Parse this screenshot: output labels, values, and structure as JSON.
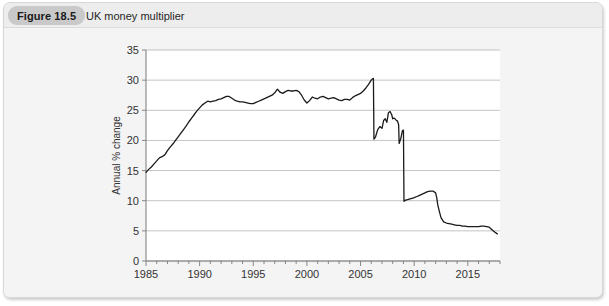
{
  "figure": {
    "badge_label": "Figure 18.5",
    "title": "UK money multiplier"
  },
  "chart_data": {
    "type": "line",
    "title": "UK money multiplier",
    "xlabel": "",
    "ylabel": "Annual % change",
    "xlim": [
      1985,
      2018
    ],
    "ylim": [
      0,
      35
    ],
    "grid": true,
    "legend": null,
    "y_ticks": [
      0,
      5,
      10,
      15,
      20,
      25,
      30,
      35
    ],
    "x_ticks": [
      1985,
      1990,
      1995,
      2000,
      2005,
      2010,
      2015
    ],
    "x_tick_labels": [
      "1985",
      "1990",
      "1995",
      "2000",
      "2005",
      "2010",
      "2015"
    ],
    "y_tick_labels": [
      "0",
      "5",
      "10",
      "15",
      "20",
      "25",
      "30",
      "35"
    ],
    "x_minor_tick_interval": 1,
    "line_color": "#1a1a1a",
    "series": [
      {
        "name": "UK money multiplier",
        "x": [
          1985.0,
          1985.25,
          1985.5,
          1985.75,
          1986.0,
          1986.25,
          1986.5,
          1986.75,
          1987.0,
          1987.25,
          1987.5,
          1987.75,
          1988.0,
          1988.25,
          1988.5,
          1988.75,
          1989.0,
          1989.25,
          1989.5,
          1989.75,
          1990.0,
          1990.25,
          1990.5,
          1990.75,
          1991.0,
          1991.25,
          1991.5,
          1991.75,
          1992.0,
          1992.25,
          1992.5,
          1992.75,
          1993.0,
          1993.25,
          1993.5,
          1993.75,
          1994.0,
          1994.25,
          1994.5,
          1994.75,
          1995.0,
          1995.25,
          1995.5,
          1995.75,
          1996.0,
          1996.25,
          1996.5,
          1996.75,
          1997.0,
          1997.25,
          1997.5,
          1997.75,
          1998.0,
          1998.25,
          1998.5,
          1998.75,
          1999.0,
          1999.25,
          1999.5,
          1999.75,
          2000.0,
          2000.25,
          2000.5,
          2000.75,
          2001.0,
          2001.25,
          2001.5,
          2001.75,
          2002.0,
          2002.25,
          2002.5,
          2002.75,
          2003.0,
          2003.25,
          2003.5,
          2003.75,
          2004.0,
          2004.25,
          2004.5,
          2004.75,
          2005.0,
          2005.25,
          2005.5,
          2005.75,
          2006.0,
          2006.1,
          2006.2,
          2006.25,
          2006.4,
          2006.6,
          2006.8,
          2007.0,
          2007.15,
          2007.3,
          2007.45,
          2007.6,
          2007.75,
          2007.9,
          2008.0,
          2008.15,
          2008.3,
          2008.45,
          2008.55,
          2008.6,
          2008.75,
          2008.9,
          2009.0,
          2009.05,
          2009.2,
          2009.4,
          2009.6,
          2009.8,
          2010.0,
          2010.25,
          2010.5,
          2010.75,
          2011.0,
          2011.25,
          2011.5,
          2011.75,
          2012.0,
          2012.1,
          2012.2,
          2012.35,
          2012.5,
          2012.75,
          2013.0,
          2013.25,
          2013.5,
          2013.75,
          2014.0,
          2014.25,
          2014.5,
          2014.75,
          2015.0,
          2015.25,
          2015.5,
          2015.75,
          2016.0,
          2016.25,
          2016.5,
          2016.75,
          2017.0,
          2017.25,
          2017.5,
          2017.75
        ],
        "values": [
          14.7,
          15.2,
          15.6,
          16.1,
          16.6,
          17.1,
          17.3,
          17.6,
          18.3,
          18.9,
          19.4,
          20.0,
          20.6,
          21.2,
          21.8,
          22.4,
          23.1,
          23.7,
          24.3,
          24.9,
          25.4,
          25.9,
          26.2,
          26.5,
          26.4,
          26.5,
          26.6,
          26.8,
          26.9,
          27.1,
          27.3,
          27.3,
          27.0,
          26.7,
          26.5,
          26.4,
          26.4,
          26.3,
          26.2,
          26.1,
          26.1,
          26.3,
          26.5,
          26.7,
          26.9,
          27.1,
          27.3,
          27.5,
          27.9,
          28.5,
          28.0,
          27.8,
          28.1,
          28.3,
          28.2,
          28.2,
          28.3,
          28.1,
          27.5,
          26.7,
          26.2,
          26.6,
          27.2,
          27.0,
          26.9,
          27.2,
          27.3,
          27.1,
          26.9,
          27.0,
          27.1,
          26.9,
          26.7,
          26.6,
          26.8,
          26.8,
          26.7,
          27.1,
          27.4,
          27.6,
          27.8,
          28.2,
          28.7,
          29.3,
          30.0,
          30.2,
          30.3,
          20.2,
          20.6,
          21.8,
          22.3,
          22.0,
          23.3,
          23.6,
          23.0,
          24.6,
          24.8,
          24.3,
          23.6,
          23.7,
          23.4,
          23.2,
          22.6,
          19.5,
          20.3,
          21.6,
          21.7,
          9.9,
          10.1,
          10.2,
          10.3,
          10.4,
          10.5,
          10.7,
          10.9,
          11.1,
          11.3,
          11.5,
          11.6,
          11.6,
          11.3,
          10.5,
          9.3,
          8.2,
          7.2,
          6.5,
          6.3,
          6.2,
          6.1,
          6.0,
          5.9,
          5.9,
          5.8,
          5.8,
          5.7,
          5.7,
          5.7,
          5.7,
          5.7,
          5.8,
          5.8,
          5.7,
          5.6,
          5.2,
          4.8,
          4.5
        ]
      }
    ]
  }
}
